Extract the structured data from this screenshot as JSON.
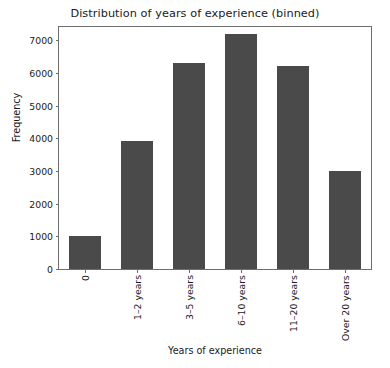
{
  "chart_data": {
    "type": "bar",
    "title": "Distribution of years of experience (binned)",
    "xlabel": "Years of experience",
    "ylabel": "Frequency",
    "categories": [
      "0",
      "1–2 years",
      "3–5 years",
      "6–10 years",
      "11–20 years",
      "Over 20 years"
    ],
    "values": [
      1000,
      3900,
      6300,
      7200,
      6200,
      3000
    ],
    "ylim": [
      0,
      7400
    ],
    "yticks": [
      0,
      1000,
      2000,
      3000,
      4000,
      5000,
      6000,
      7000
    ],
    "ytick_labels": [
      "0",
      "1000",
      "2000",
      "3000",
      "4000",
      "5000",
      "6000",
      "7000"
    ],
    "grid": false,
    "legend": false,
    "bar_color": "#4a4a4a",
    "axes_color": "#6e6e6e",
    "background": "#ffffff",
    "xtick_rotation": 90
  }
}
